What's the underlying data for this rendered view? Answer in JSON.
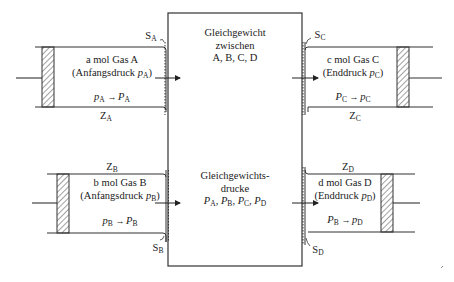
{
  "diagram": {
    "central_box": {
      "upper_text": [
        "Gleichgewicht",
        "zwischen",
        "A, B, C, D"
      ],
      "lower_text": [
        "Gleichgewichts-",
        "drucke"
      ],
      "pressures": [
        {
          "symbol": "P",
          "sub": "A"
        },
        {
          "symbol": "P",
          "sub": "B"
        },
        {
          "symbol": "P",
          "sub": "C"
        },
        {
          "symbol": "P",
          "sub": "D"
        }
      ],
      "pressure_separator": ", "
    },
    "cylinders": {
      "A": {
        "line1": "a mol Gas A",
        "line2_prefix": "(Anfangsdruck ",
        "line2_var": "p",
        "line2_sub": "A",
        "line2_suffix": ")",
        "change_from": "p",
        "change_from_sub": "A",
        "arrow": "→",
        "change_to": "P",
        "change_to_sub": "A",
        "Z_label": "Z",
        "Z_sub": "A",
        "S_label": "S",
        "S_sub": "A"
      },
      "B": {
        "line1": "b mol Gas B",
        "line2_prefix": "(Anfangsdruck ",
        "line2_var": "p",
        "line2_sub": "B",
        "line2_suffix": ")",
        "change_from": "p",
        "change_from_sub": "B",
        "arrow": "→",
        "change_to": "P",
        "change_to_sub": "B",
        "Z_label": "Z",
        "Z_sub": "B",
        "S_label": "S",
        "S_sub": "B"
      },
      "C": {
        "line1": "c mol Gas C",
        "line2_prefix": "(Enddruck ",
        "line2_var": "p",
        "line2_sub": "C",
        "line2_suffix": ")",
        "change_from": "P",
        "change_from_sub": "C",
        "arrow": "→",
        "change_to": "p",
        "change_to_sub": "C",
        "Z_label": "Z",
        "Z_sub": "C",
        "S_label": "S",
        "S_sub": "C"
      },
      "D": {
        "line1": "d mol Gas D",
        "line2_prefix": "(Enddruck ",
        "line2_var": "p",
        "line2_sub": "D",
        "line2_suffix": ")",
        "change_from": "P",
        "change_from_sub": "B",
        "arrow": "→",
        "change_to": "p",
        "change_to_sub": "D",
        "Z_label": "Z",
        "Z_sub": "D",
        "S_label": "S",
        "S_sub": "D"
      }
    },
    "colors": {
      "line": "#333333",
      "hatch": "#444444",
      "background": "#ffffff"
    }
  }
}
